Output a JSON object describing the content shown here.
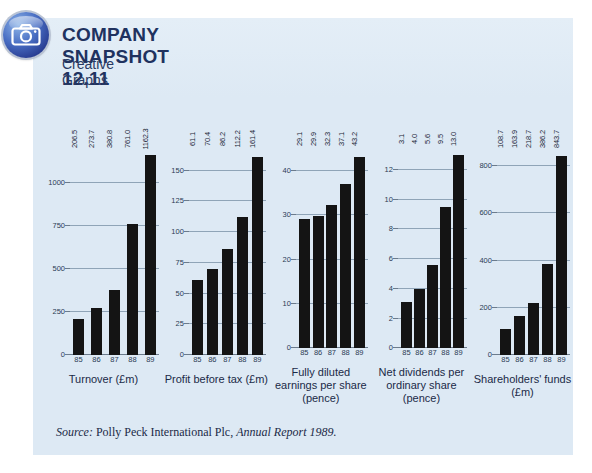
{
  "header": {
    "icon": "camera-icon",
    "title": "COMPANY SNAPSHOT 12.11",
    "subtitle": "Creative Graphs"
  },
  "source": {
    "label": "Source:",
    "text": " Polly Peck International Plc, ",
    "italic_ref": "Annual Report 1989."
  },
  "chart_data": [
    {
      "type": "bar",
      "title": "Turnover (£m)",
      "xlabel": "",
      "ylabel": "",
      "categories": [
        "85",
        "86",
        "87",
        "88",
        "89"
      ],
      "values": [
        206.5,
        273.7,
        380.8,
        761.0,
        1162.3
      ],
      "value_labels": [
        "206.5",
        "273.7",
        "380.8",
        "761.0",
        "1162.3"
      ],
      "yticks": [
        0,
        250,
        500,
        750,
        1000
      ],
      "ytick_labels": [
        "0",
        "250",
        "500",
        "750",
        "1000"
      ],
      "ylim": [
        0,
        1250
      ],
      "grid": true,
      "legend": "none"
    },
    {
      "type": "bar",
      "title": "Profit before tax (£m)",
      "xlabel": "",
      "ylabel": "",
      "categories": [
        "85",
        "86",
        "87",
        "88",
        "89"
      ],
      "values": [
        61.1,
        70.4,
        86.2,
        112.2,
        161.4
      ],
      "value_labels": [
        "61.1",
        "70.4",
        "86.2",
        "112.2",
        "161.4"
      ],
      "yticks": [
        0,
        25,
        50,
        75,
        100,
        125,
        150
      ],
      "ytick_labels": [
        "0",
        "25",
        "50",
        "75",
        "100",
        "125",
        "150"
      ],
      "ylim": [
        0,
        175
      ],
      "grid": true,
      "legend": "none"
    },
    {
      "type": "bar",
      "title": "Fully diluted earnings per share (pence)",
      "xlabel": "",
      "ylabel": "",
      "categories": [
        "85",
        "86",
        "87",
        "88",
        "89"
      ],
      "values": [
        29.1,
        29.9,
        32.3,
        37.1,
        43.2
      ],
      "value_labels": [
        "29.1",
        "29.9",
        "32.3",
        "37.1",
        "43.2"
      ],
      "yticks": [
        0,
        10,
        20,
        30,
        40
      ],
      "ytick_labels": [
        "0",
        "10",
        "20",
        "30",
        "40"
      ],
      "ylim": [
        0,
        47
      ],
      "grid": true,
      "legend": "none"
    },
    {
      "type": "bar",
      "title": "Net dividends per ordinary share (pence)",
      "xlabel": "",
      "ylabel": "",
      "categories": [
        "85",
        "86",
        "87",
        "88",
        "89"
      ],
      "values": [
        3.1,
        4.0,
        5.6,
        9.5,
        13.0
      ],
      "value_labels": [
        "3.1",
        "4.0",
        "5.6",
        "9.5",
        "13.0"
      ],
      "yticks": [
        0,
        2,
        4,
        6,
        8,
        10,
        12
      ],
      "ytick_labels": [
        "0",
        "2",
        "4",
        "6",
        "8",
        "10",
        "12"
      ],
      "ylim": [
        0,
        14
      ],
      "grid": true,
      "legend": "none"
    },
    {
      "type": "bar",
      "title": "Shareholders' funds (£m)",
      "xlabel": "",
      "ylabel": "",
      "categories": [
        "85",
        "86",
        "87",
        "88",
        "89"
      ],
      "values": [
        108.7,
        163.9,
        218.7,
        386.2,
        843.7
      ],
      "value_labels": [
        "108.7",
        "163.9",
        "218.7",
        "386.2",
        "843.7"
      ],
      "yticks": [
        0,
        200,
        400,
        600,
        800
      ],
      "ytick_labels": [
        "0",
        "200",
        "400",
        "600",
        "800"
      ],
      "ylim": [
        0,
        910
      ],
      "grid": true,
      "legend": "none"
    }
  ],
  "colors": {
    "panel_background": "#dde9f4",
    "bar": "#141414",
    "title": "#20325f",
    "axis": "#6b7b8c",
    "grid": "#8fa4b7"
  }
}
